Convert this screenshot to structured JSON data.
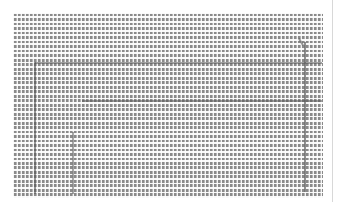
{
  "image": {
    "description": "Scanned woven fabric / graph-paper texture with faint dashed dark lines forming rectangular divisions",
    "colors": {
      "background": "#ffffff",
      "texture": "#8a8a8a",
      "line": "#555555"
    }
  }
}
